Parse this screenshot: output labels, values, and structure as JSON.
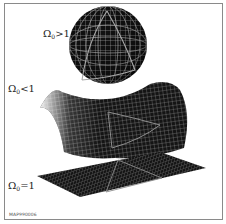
{
  "figure": {
    "surfaces": [
      {
        "id": "closed",
        "symbol": "Ω",
        "subscript": "0",
        "relation": ">",
        "value": "1",
        "shape": "sphere"
      },
      {
        "id": "open",
        "symbol": "Ω",
        "subscript": "0",
        "relation": "<",
        "value": "1",
        "shape": "saddle"
      },
      {
        "id": "flat",
        "symbol": "Ω",
        "subscript": "0",
        "relation": "=",
        "value": "1",
        "shape": "plane"
      }
    ],
    "caption_code": "MAP990006",
    "colors": {
      "surface": "#111111",
      "grid": "#c8c8c8",
      "triangle": "#9a9a9a",
      "border": "#8a8a8a",
      "background": "#ffffff"
    }
  }
}
